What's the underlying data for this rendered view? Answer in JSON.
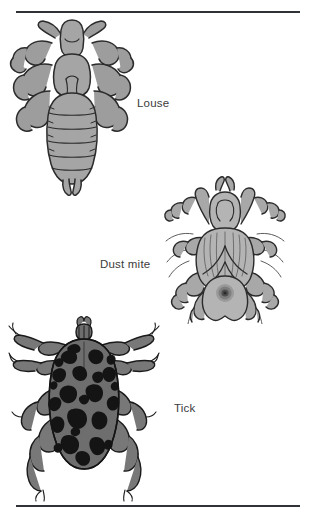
{
  "figure": {
    "background_color": "#ffffff",
    "rule_color": "#2f3237",
    "label_color": "#3b3b3b",
    "top_rule": "",
    "bottom_rule": ""
  },
  "specimens": [
    {
      "id": "louse",
      "label": "Louse",
      "icon_name": "louse-illustration",
      "body_fill": "#a5a5a5",
      "body_shade": "#9a9a9a",
      "outline": "#2b2b2b",
      "leg_fill": "#9d9d9d"
    },
    {
      "id": "dust-mite",
      "label": "Dust mite",
      "icon_name": "dust-mite-illustration",
      "body_fill": "#b4b4b4",
      "body_shade": "#a2a2a2",
      "outline": "#2b2b2b",
      "leg_fill": "#a8a8a8"
    },
    {
      "id": "tick",
      "label": "Tick",
      "icon_name": "tick-illustration",
      "body_fill": "#6e6e6e",
      "body_shade": "#141414",
      "outline": "#1a1a1a",
      "leg_fill": "#787878"
    }
  ]
}
